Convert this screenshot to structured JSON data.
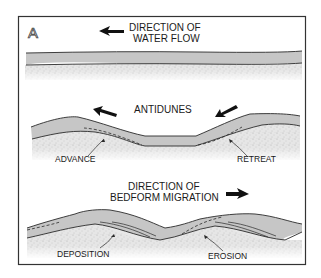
{
  "figure": {
    "panel_label": "A",
    "colors": {
      "frame": "#333333",
      "water": "#c6c6c6",
      "sediment": "#e4e4e4",
      "line": "#2a2a2a"
    }
  },
  "section1": {
    "title_line1": "DIRECTION OF",
    "title_line2": "WATER FLOW",
    "arrow_direction": "left"
  },
  "section2": {
    "title": "ANTIDUNES",
    "left_arrow_direction": "up-left",
    "right_arrow_direction": "down-left",
    "label_left": "ADVANCE",
    "label_right": "RETREAT"
  },
  "section3": {
    "title_line1": "DIRECTION OF",
    "title_line2": "BEDFORM MIGRATION",
    "arrow_direction": "right",
    "label_left": "DEPOSITION",
    "label_right": "EROSION"
  }
}
